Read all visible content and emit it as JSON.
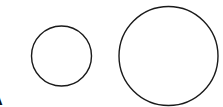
{
  "diagram": {
    "label": "A",
    "stroke_color": "#1a1a1a",
    "background": "#ffffff",
    "shapes": [
      {
        "type": "circle",
        "name": "small-circle",
        "cx": 61.5,
        "cy": 56,
        "r": 30
      },
      {
        "type": "circle",
        "name": "large-circle",
        "cx": 168.5,
        "cy": 56,
        "r": 49.5
      }
    ]
  }
}
